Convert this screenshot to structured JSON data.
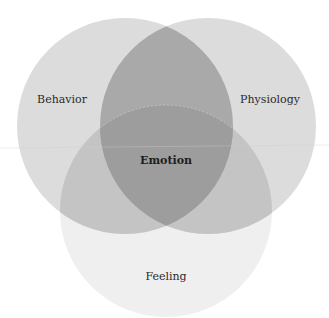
{
  "diagram": {
    "type": "venn-3",
    "sets": [
      {
        "label": "Behavior",
        "color": "#dcdcdc"
      },
      {
        "label": "Physiology",
        "color": "#dcdcdc"
      },
      {
        "label": "Feeling",
        "color": "#efefef"
      }
    ],
    "center_label": "Emotion",
    "colors": {
      "top_overlap": "#a9a9a9",
      "side_bottom_overlap": "#c4c4c4",
      "triple_overlap": "#9d9d9d"
    }
  }
}
